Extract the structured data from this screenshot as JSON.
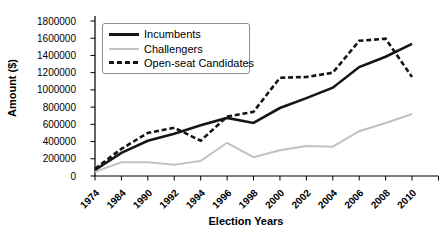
{
  "chart_data": {
    "type": "line",
    "title": "",
    "xlabel": "Election Years",
    "ylabel": "Amount ($)",
    "categories": [
      "1974",
      "1984",
      "1990",
      "1992",
      "1994",
      "1996",
      "1998",
      "2000",
      "2002",
      "2004",
      "2006",
      "2008",
      "2010"
    ],
    "y_ticks": [
      0,
      200000,
      400000,
      600000,
      800000,
      1000000,
      1200000,
      1400000,
      1600000,
      1800000
    ],
    "y_tick_labels": [
      "0",
      "200000",
      "400000",
      "600000",
      "800000",
      "1000000",
      "1200000",
      "1400000",
      "1600000",
      "1800000"
    ],
    "ylim": [
      0,
      1800000
    ],
    "grid": false,
    "legend_position": "top-left-inside",
    "axis_color": "#000000",
    "series": [
      {
        "name": "Incumbents",
        "line_style": "solid",
        "color": "#151515",
        "width": 2.6,
        "values": [
          70000,
          270000,
          410000,
          490000,
          590000,
          675000,
          615000,
          790000,
          905000,
          1025000,
          1265000,
          1385000,
          1535000
        ]
      },
      {
        "name": "Challengers",
        "line_style": "solid",
        "color": "#c1c1c1",
        "width": 2,
        "values": [
          50000,
          160000,
          160000,
          130000,
          175000,
          385000,
          220000,
          300000,
          350000,
          340000,
          520000,
          615000,
          720000
        ]
      },
      {
        "name": "Open-seat Candidates",
        "line_style": "dashed",
        "color": "#151515",
        "width": 2.6,
        "values": [
          85000,
          315000,
          500000,
          560000,
          410000,
          690000,
          745000,
          1140000,
          1150000,
          1200000,
          1570000,
          1595000,
          1150000
        ]
      }
    ]
  },
  "legend": {
    "items": [
      {
        "label": "Incumbents"
      },
      {
        "label": "Challengers"
      },
      {
        "label": "Open-seat Candidates"
      }
    ]
  }
}
